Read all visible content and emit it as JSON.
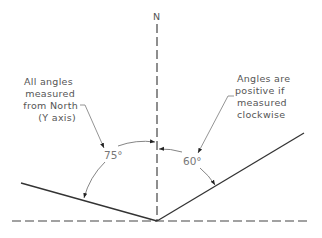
{
  "diagram": {
    "north_label": "N",
    "left_note": [
      "All angles",
      "measured",
      "from North",
      "(Y axis)"
    ],
    "right_note": [
      "Angles are",
      "positive if",
      "measured",
      "clockwise"
    ],
    "angle_left": "75°",
    "angle_right": "60°",
    "colors": {
      "line": "#333333",
      "dashed": "#444444",
      "leader": "#888888",
      "text": "#555555"
    }
  }
}
